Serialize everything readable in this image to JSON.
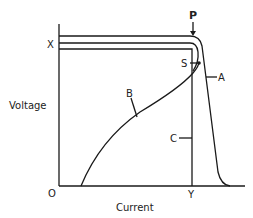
{
  "diagram": {
    "axes": {
      "x_label": "Current",
      "y_label": "Voltage",
      "origin_label": "O",
      "x_marker_label": "Y",
      "y_marker_label": "X"
    },
    "curves": [
      {
        "id": "A",
        "label": "A",
        "description": "outer characteristic, flat then steep drop"
      },
      {
        "id": "B",
        "label": "B",
        "description": "rising curve from lower axis to point S"
      },
      {
        "id": "C",
        "label": "C",
        "description": "rectangular characteristic dropping vertically at Y"
      }
    ],
    "points": [
      {
        "id": "P",
        "label": "P"
      },
      {
        "id": "S",
        "label": "S"
      }
    ],
    "colors": {
      "line": "#1a1a1a",
      "background": "#ffffff"
    }
  }
}
